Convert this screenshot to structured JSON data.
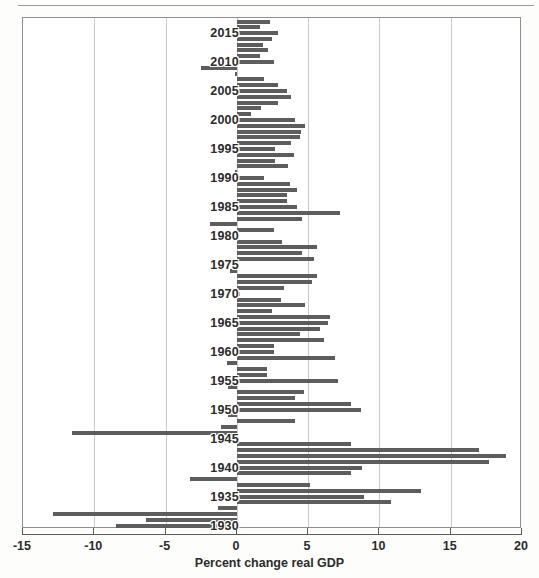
{
  "chart_data": {
    "type": "bar",
    "orientation": "horizontal",
    "title": "",
    "xlabel": "Percent change real GDP",
    "ylabel": "",
    "xlim": [
      -15,
      20
    ],
    "ylim": [
      1929.4,
      2017.6
    ],
    "grid": "vertical",
    "legend": "none",
    "bar_color": "#5d5d5d",
    "xticks": [
      -15,
      -10,
      -5,
      0,
      5,
      10,
      15,
      20
    ],
    "xtick_labels": [
      "-15",
      "-10",
      "-5",
      "0",
      "5",
      "10",
      "15",
      "20"
    ],
    "ytick_labels": [
      "1930",
      "1935",
      "1940",
      "1945",
      "1950",
      "1955",
      "1960",
      "1965",
      "1970",
      "1975",
      "1980",
      "1985",
      "1990",
      "1995",
      "2000",
      "2005",
      "2010",
      "2015"
    ],
    "yticks": [
      1930,
      1935,
      1940,
      1945,
      1950,
      1955,
      1960,
      1965,
      1970,
      1975,
      1980,
      1985,
      1990,
      1995,
      2000,
      2005,
      2010,
      2015
    ],
    "categories": [
      1930,
      1931,
      1932,
      1933,
      1934,
      1935,
      1936,
      1937,
      1938,
      1939,
      1940,
      1941,
      1942,
      1943,
      1944,
      1945,
      1946,
      1947,
      1948,
      1949,
      1950,
      1951,
      1952,
      1953,
      1954,
      1955,
      1956,
      1957,
      1958,
      1959,
      1960,
      1961,
      1962,
      1963,
      1964,
      1965,
      1966,
      1967,
      1968,
      1969,
      1970,
      1971,
      1972,
      1973,
      1974,
      1975,
      1976,
      1977,
      1978,
      1979,
      1980,
      1981,
      1982,
      1983,
      1984,
      1985,
      1986,
      1987,
      1988,
      1989,
      1990,
      1991,
      1992,
      1993,
      1994,
      1995,
      1996,
      1997,
      1998,
      1999,
      2000,
      2001,
      2002,
      2003,
      2004,
      2005,
      2006,
      2007,
      2008,
      2009,
      2010,
      2011,
      2012,
      2013,
      2014,
      2015,
      2016,
      2017
    ],
    "values": [
      -8.5,
      -6.4,
      -12.9,
      -1.3,
      10.8,
      8.9,
      12.9,
      5.1,
      -3.3,
      8.0,
      8.8,
      17.7,
      18.9,
      17.0,
      8.0,
      -1.0,
      -11.6,
      -1.1,
      4.1,
      -0.6,
      8.7,
      8.0,
      4.1,
      4.7,
      -0.6,
      7.1,
      2.1,
      2.1,
      -0.7,
      6.9,
      2.6,
      2.6,
      6.1,
      4.4,
      5.8,
      6.4,
      6.5,
      2.5,
      4.8,
      3.1,
      0.2,
      3.3,
      5.3,
      5.6,
      -0.5,
      -0.2,
      5.4,
      4.6,
      5.6,
      3.2,
      -0.2,
      2.6,
      -1.9,
      4.6,
      7.2,
      4.2,
      3.5,
      3.5,
      4.2,
      3.7,
      1.9,
      -0.1,
      3.6,
      2.7,
      4.0,
      2.7,
      3.8,
      4.4,
      4.5,
      4.8,
      4.1,
      1.0,
      1.7,
      2.9,
      3.8,
      3.5,
      2.9,
      1.9,
      -0.1,
      -2.5,
      2.6,
      1.6,
      2.2,
      1.8,
      2.5,
      2.9,
      1.6,
      2.3
    ]
  },
  "axis": {
    "xtitle": "Percent change real GDP"
  }
}
